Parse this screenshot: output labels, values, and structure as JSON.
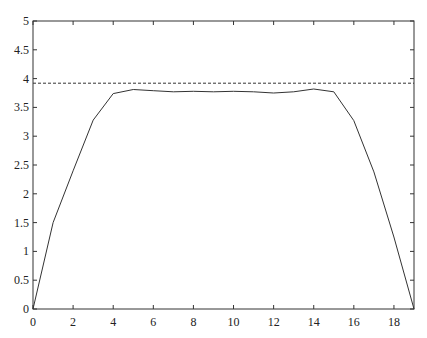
{
  "chart_data": {
    "type": "line",
    "title": "",
    "xlabel": "",
    "ylabel": "",
    "xlim": [
      0,
      19
    ],
    "ylim": [
      0,
      5
    ],
    "grid": false,
    "legend": null,
    "xticks": [
      0,
      2,
      4,
      6,
      8,
      10,
      12,
      14,
      16,
      18
    ],
    "yticks": [
      0,
      0.5,
      1,
      1.5,
      2,
      2.5,
      3,
      3.5,
      4,
      4.5,
      5
    ],
    "xtick_labels": [
      "0",
      "2",
      "4",
      "6",
      "8",
      "10",
      "12",
      "14",
      "16",
      "18"
    ],
    "ytick_labels": [
      "0",
      "0.5",
      "1",
      "1.5",
      "2",
      "2.5",
      "3",
      "3.5",
      "4",
      "4.5",
      "5"
    ],
    "series": [
      {
        "name": "profile",
        "style": "solid",
        "color": "#333333",
        "x": [
          0,
          1,
          2,
          3,
          4,
          5,
          6,
          7,
          8,
          9,
          10,
          11,
          12,
          13,
          14,
          15,
          16,
          17,
          18,
          19
        ],
        "values": [
          0,
          1.5,
          2.4,
          3.28,
          3.74,
          3.81,
          3.79,
          3.77,
          3.78,
          3.77,
          3.78,
          3.77,
          3.75,
          3.77,
          3.82,
          3.77,
          3.27,
          2.38,
          1.25,
          0
        ]
      },
      {
        "name": "reference",
        "style": "dashed",
        "color": "#333333",
        "x": [
          0,
          19
        ],
        "values": [
          3.92,
          3.92
        ]
      }
    ]
  }
}
